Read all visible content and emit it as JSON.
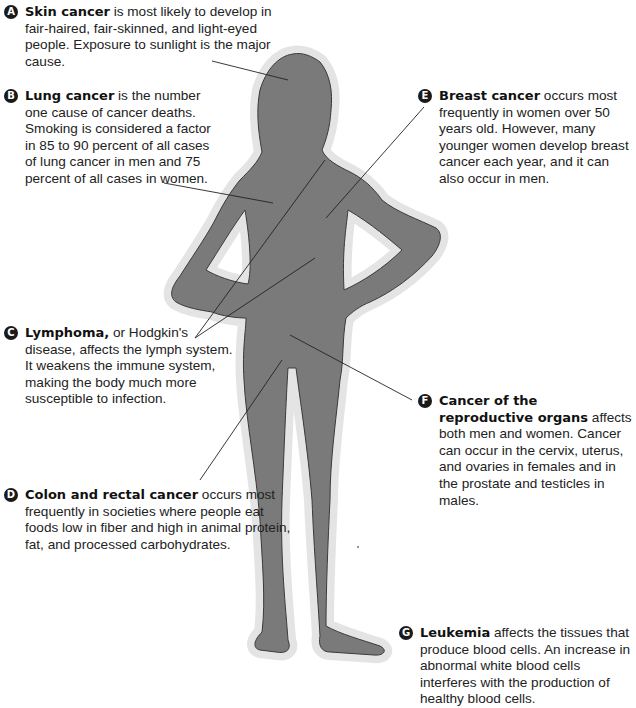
{
  "diagram": {
    "colors": {
      "silhouette_fill": "#7a7a7a",
      "silhouette_outline": "#3a3a3a",
      "halo": "#e4e4e4",
      "leader_line": "#222222",
      "badge": "#1a1a1a",
      "text": "#222222"
    }
  },
  "callouts": [
    {
      "letter": "A",
      "title": "Skin cancer",
      "text": " is most likely to develop in fair-haired, fair-skinned, and light-eyed people. Exposure to sunlight is the major cause."
    },
    {
      "letter": "B",
      "title": "Lung cancer",
      "text": " is the number one cause of cancer deaths. Smoking is considered a factor in 85 to 90 percent of all cases of lung cancer in men and 75 percent of all cases in women."
    },
    {
      "letter": "C",
      "title": "Lymphoma,",
      "text": " or Hodgkin's disease, affects the lymph system. It weakens the immune system, making the body much more susceptible to infection."
    },
    {
      "letter": "D",
      "title": "Colon and rectal cancer",
      "text": " occurs most frequently in societies where people eat foods low in fiber and high in animal protein, fat, and processed carbohydrates."
    },
    {
      "letter": "E",
      "title": "Breast cancer",
      "text": " occurs most frequently in women over 50 years old. However, many younger women develop breast cancer each year, and it can also occur in men."
    },
    {
      "letter": "F",
      "title": "Cancer of the reproductive organs",
      "text": " affects both men and women. Cancer can occur in the cervix, uterus, and ovaries in females and in the prostate and testicles in males."
    },
    {
      "letter": "G",
      "title": "Leukemia",
      "text": " affects the tissues that produce blood cells. An increase in abnormal white blood cells interferes with the production of healthy blood cells."
    }
  ]
}
